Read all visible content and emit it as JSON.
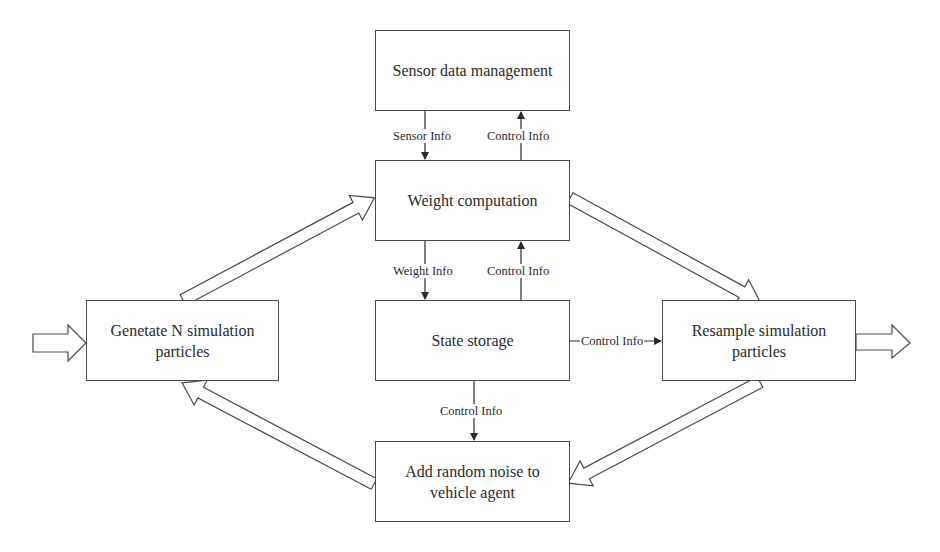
{
  "diagram": {
    "type": "flowchart",
    "nodes": [
      {
        "id": "sensor",
        "label": "Sensor data management"
      },
      {
        "id": "weight",
        "label": "Weight computation"
      },
      {
        "id": "state",
        "label": "State storage"
      },
      {
        "id": "generate",
        "label": "Genetate N simulation particles"
      },
      {
        "id": "resample",
        "label": "Resample simulation particles"
      },
      {
        "id": "noise",
        "label": "Add random noise to vehicle agent"
      }
    ],
    "edges": [
      {
        "from": "sensor",
        "to": "weight",
        "label": "Sensor Info",
        "style": "line-arrow"
      },
      {
        "from": "weight",
        "to": "sensor",
        "label": "Control Info",
        "style": "line-arrow"
      },
      {
        "from": "weight",
        "to": "state",
        "label": "Weight Info",
        "style": "line-arrow"
      },
      {
        "from": "state",
        "to": "weight",
        "label": "Control Info",
        "style": "line-arrow"
      },
      {
        "from": "state",
        "to": "resample",
        "label": "Control Info",
        "style": "line-arrow"
      },
      {
        "from": "state",
        "to": "noise",
        "label": "Control Info",
        "style": "line-arrow"
      },
      {
        "from": "input",
        "to": "generate",
        "label": "",
        "style": "block-arrow"
      },
      {
        "from": "generate",
        "to": "weight",
        "label": "",
        "style": "block-arrow"
      },
      {
        "from": "weight",
        "to": "resample",
        "label": "",
        "style": "block-arrow"
      },
      {
        "from": "resample",
        "to": "noise",
        "label": "",
        "style": "block-arrow"
      },
      {
        "from": "noise",
        "to": "generate",
        "label": "",
        "style": "block-arrow"
      },
      {
        "from": "resample",
        "to": "output",
        "label": "",
        "style": "block-arrow"
      }
    ]
  },
  "boxes": {
    "sensor": "Sensor data management",
    "weight": "Weight computation",
    "state": "State storage",
    "generate_line1": "Genetate N simulation",
    "generate_line2": "particles",
    "resample_line1": "Resample simulation",
    "resample_line2": "particles",
    "noise_line1": "Add random noise to",
    "noise_line2": "vehicle agent"
  },
  "labels": {
    "sensor_info": "Sensor Info",
    "control_info_top": "Control Info",
    "weight_info": "Weight Info",
    "control_info_mid": "Control Info",
    "control_info_right": "Control Info",
    "control_info_bottom": "Control Info"
  },
  "colors": {
    "stroke": "#4a4a4a",
    "background": "#ffffff",
    "text": "#2a2a2a"
  }
}
